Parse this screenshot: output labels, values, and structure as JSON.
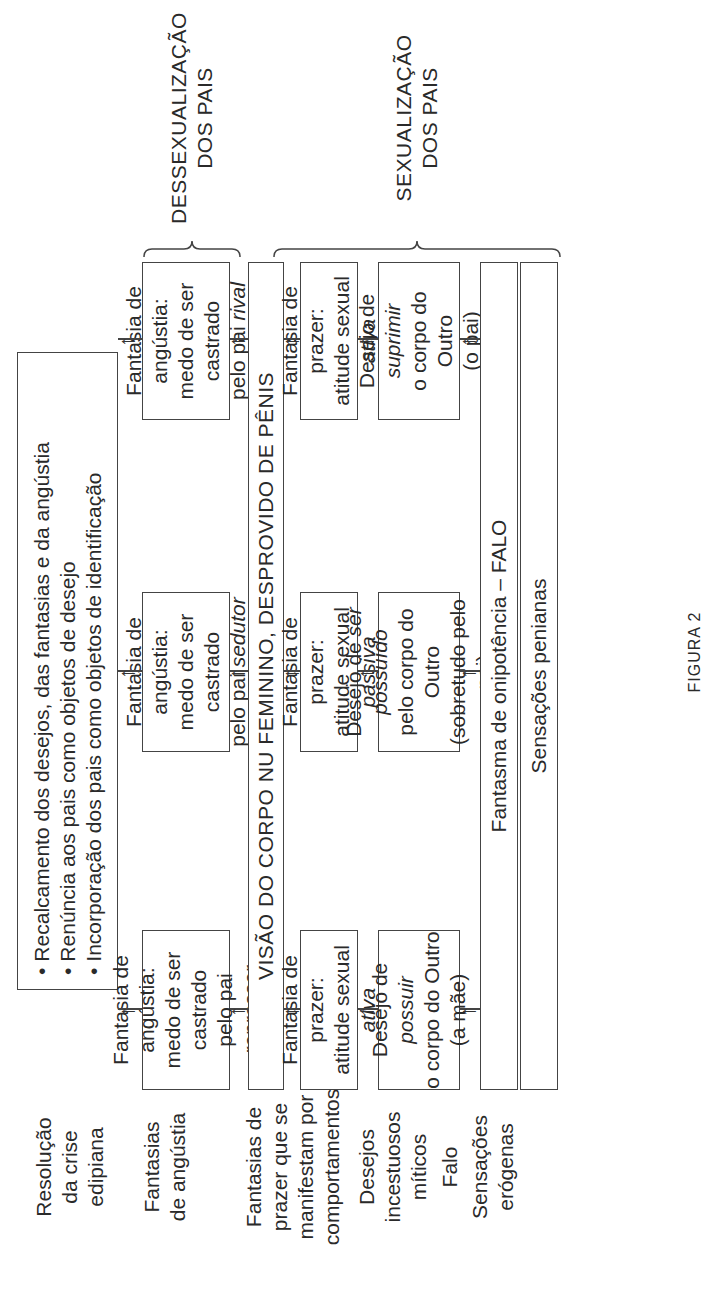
{
  "figure_caption": "FIGURA 2",
  "row_labels": {
    "resolucao": [
      "Resolução",
      "da crise",
      "edipiana"
    ],
    "angustia": [
      "Fantasias",
      "de angústia"
    ],
    "prazer": [
      "Fantasias de",
      "prazer que se",
      "manifestam por",
      "comportamentos"
    ],
    "desejos": [
      "Desejos",
      "incestuosos",
      "míticos"
    ],
    "falo": [
      "Falo"
    ],
    "sensacoes": [
      "Sensações",
      "erógenas"
    ]
  },
  "resolucao_box": {
    "items": [
      "Recalcamento dos desejos, das fantasias e da angústia",
      "Renúncia aos pais como objetos de desejo",
      "Incorporação dos pais como objetos de identificação"
    ]
  },
  "angustia_boxes": [
    {
      "line1": "Fantasia de angústia:",
      "line2": "medo de ser castrado",
      "line3_prefix": "pelo pai ",
      "line3_italic": "repressor"
    },
    {
      "line1": "Fantasia de angústia:",
      "line2": "medo de ser castrado",
      "line3_prefix": "pelo pai ",
      "line3_italic": "sedutor"
    },
    {
      "line1": "Fantasia de angústia:",
      "line2": "medo de ser castrado",
      "line3_prefix": "pelo pai ",
      "line3_italic": "rival"
    }
  ],
  "visao_bar": "VISÃO DO CORPO NU FEMININO, DESPROVIDO DE PÊNIS",
  "prazer_boxes": [
    {
      "line1": "Fantasia de prazer:",
      "line2_prefix": "atitude sexual ",
      "line2_italic": "ativa"
    },
    {
      "line1": "Fantasia de prazer:",
      "line2_prefix": "atitude sexual ",
      "line2_italic": "passiva"
    },
    {
      "line1": "Fantasia de prazer:",
      "line2_prefix": "atitude sexual ",
      "line2_italic": "ativa"
    }
  ],
  "desejo_boxes": [
    {
      "line1_prefix": "Desejo de ",
      "line1_italic": "possuir",
      "line2": "o corpo do Outro",
      "line3": "(a mãe)"
    },
    {
      "line1_prefix": "Desejo de ",
      "line1_italic": "ser possuído",
      "line2": "pelo corpo do Outro",
      "line3": "(sobretudo pelo pai)"
    },
    {
      "line1_prefix": "Desejo de ",
      "line1_italic": "suprimir",
      "line2": "o corpo do Outro",
      "line3": "(o pai)"
    }
  ],
  "falo_bar": "Fantasma de onipotência – FALO",
  "sensacoes_bar": "Sensações penianas",
  "brackets": {
    "dessexualizacao": [
      "DESSEXUALIZAÇÃO",
      "DOS PAIS"
    ],
    "sexualizacao": [
      "SEXUALIZAÇÃO",
      "DOS PAIS"
    ]
  },
  "colors": {
    "line": "#444444",
    "text": "#2a2a2a",
    "background": "#ffffff"
  }
}
